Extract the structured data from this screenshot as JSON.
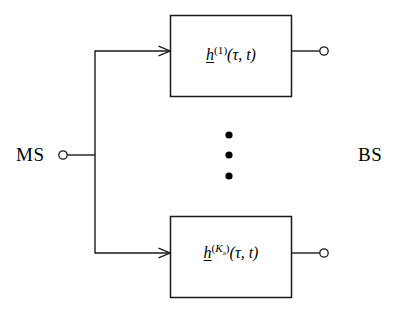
{
  "diagram": {
    "stroke_color": "#1a1a1a",
    "background_color": "#ffffff",
    "nodes": {
      "ms": {
        "label": "MS",
        "terminal_icon": "open-circle-terminal"
      },
      "bs": {
        "label": "BS"
      }
    },
    "blocks": [
      {
        "id": "block-1",
        "base_symbol": "h",
        "superscript": "(1)",
        "arguments": "(τ, t)",
        "full_label": "h^(1)(τ, t)",
        "input_icon": "arrow-right-icon",
        "output_icon": "open-circle-terminal"
      },
      {
        "id": "block-k",
        "base_symbol": "h",
        "superscript_base": "K",
        "superscript_sub": "a",
        "superscript": "(Kₐ)",
        "arguments": "(τ, t)",
        "full_label": "h^(Kₐ)(τ, t)",
        "input_icon": "arrow-right-icon",
        "output_icon": "open-circle-terminal"
      }
    ],
    "ellipsis": {
      "icon": "vertical-ellipsis-icon",
      "dot_count": 3
    }
  }
}
